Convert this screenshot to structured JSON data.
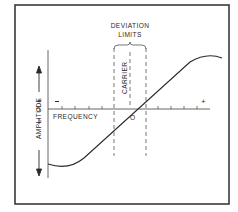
{
  "diagram": {
    "title_labels": {
      "deviation_line1": "DEVIATION",
      "deviation_line2": "LIMITS",
      "carrier": "CARRIER",
      "x_axis": "FREQUENCY",
      "y_axis": "AMPLITUDE",
      "y_plus": "+",
      "y_zero": "0",
      "y_minus": "I",
      "x_minus": "−",
      "x_plus": "+",
      "origin": "O"
    },
    "colors": {
      "line": "#2a2a2a",
      "border": "#3a3a3a",
      "background": "#ffffff"
    }
  }
}
